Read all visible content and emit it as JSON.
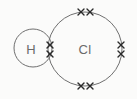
{
  "diagram": {
    "type": "dot-and-cross bonding diagram",
    "molecule": "HCl",
    "background_color": "#fbfbfa",
    "circle_stroke_color": "#6f6f6f",
    "label_color": "#6a6a6a",
    "electron_color": "#2b2b2b",
    "width": 137,
    "height": 99
  },
  "atoms": [
    {
      "id": "hydrogen",
      "label": "H",
      "element": "H",
      "cx": 33,
      "cy": 48,
      "r": 19,
      "label_x": 31,
      "label_y": 49
    },
    {
      "id": "chlorine",
      "label": "Cl",
      "element": "Cl",
      "cx": 85,
      "cy": 49,
      "r": 37,
      "label_x": 85,
      "label_y": 49
    }
  ],
  "electron_groups": [
    {
      "id": "bonding-pair",
      "name": "shared bonding pair",
      "position": "overlap",
      "count": 2,
      "marks": [
        {
          "glyph": "cross",
          "x": 50,
          "y": 45
        },
        {
          "glyph": "cross",
          "x": 50,
          "y": 54
        }
      ]
    },
    {
      "id": "lone-pair-top",
      "name": "lone pair top",
      "position": "top",
      "count": 2,
      "marks": [
        {
          "glyph": "cross",
          "x": 81,
          "y": 12
        },
        {
          "glyph": "cross",
          "x": 90,
          "y": 12
        }
      ]
    },
    {
      "id": "lone-pair-right",
      "name": "lone pair right",
      "position": "right",
      "count": 2,
      "marks": [
        {
          "glyph": "cross",
          "x": 121,
          "y": 45
        },
        {
          "glyph": "cross",
          "x": 121,
          "y": 54
        }
      ]
    },
    {
      "id": "lone-pair-bottom",
      "name": "lone pair bottom",
      "position": "bottom",
      "count": 2,
      "marks": [
        {
          "glyph": "cross",
          "x": 81,
          "y": 86
        },
        {
          "glyph": "cross",
          "x": 90,
          "y": 86
        }
      ]
    }
  ]
}
